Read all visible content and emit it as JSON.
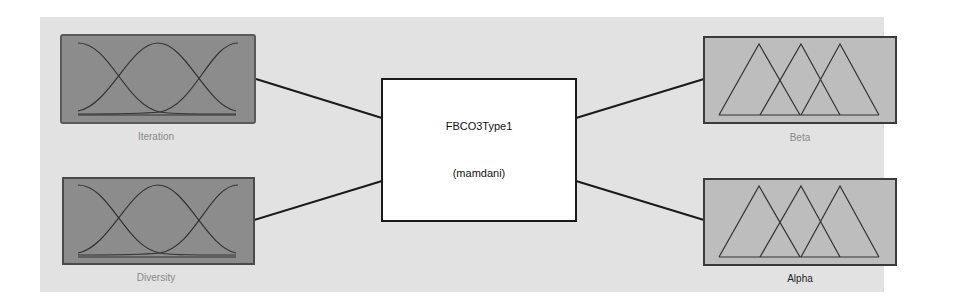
{
  "system": {
    "name": "FBCO3Type1",
    "type": "(mamdani)"
  },
  "inputs": [
    {
      "name": "Iteration",
      "mf_shape": "gaussian",
      "mf_count": 3,
      "fill": "#8c8c8c",
      "label_color": "#8a8a8a"
    },
    {
      "name": "Diversity",
      "mf_shape": "gaussian",
      "mf_count": 3,
      "fill": "#8c8c8c",
      "label_color": "#8a8a8a"
    }
  ],
  "outputs": [
    {
      "name": "Beta",
      "mf_shape": "triangular",
      "mf_count": 3,
      "fill": "#bdbdbd",
      "label_color": "#8a8a8a"
    },
    {
      "name": "Alpha",
      "mf_shape": "triangular",
      "mf_count": 3,
      "fill": "#bdbdbd",
      "label_color": "#222222"
    }
  ],
  "colors": {
    "background": "#e2e2e2",
    "line": "#1a1a1a",
    "system_box": "#ffffff"
  }
}
